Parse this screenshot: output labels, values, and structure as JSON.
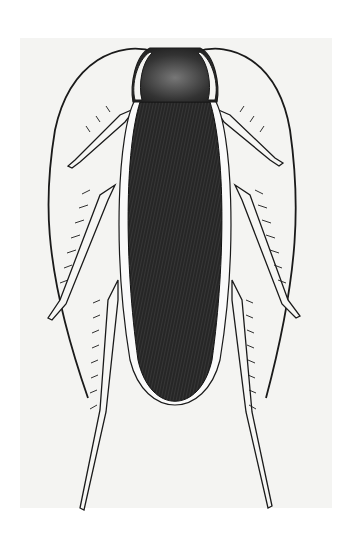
{
  "figure": {
    "subject": "cockroach",
    "view": "dorsal",
    "style": "engraved illustration",
    "colors": {
      "background": "#ffffff",
      "plate": "#f4f4f2",
      "wing": "#2a2a2a",
      "pronotum": "#4a4a4a",
      "outline": "#1a1a1a",
      "margin": "#fafafa"
    }
  }
}
